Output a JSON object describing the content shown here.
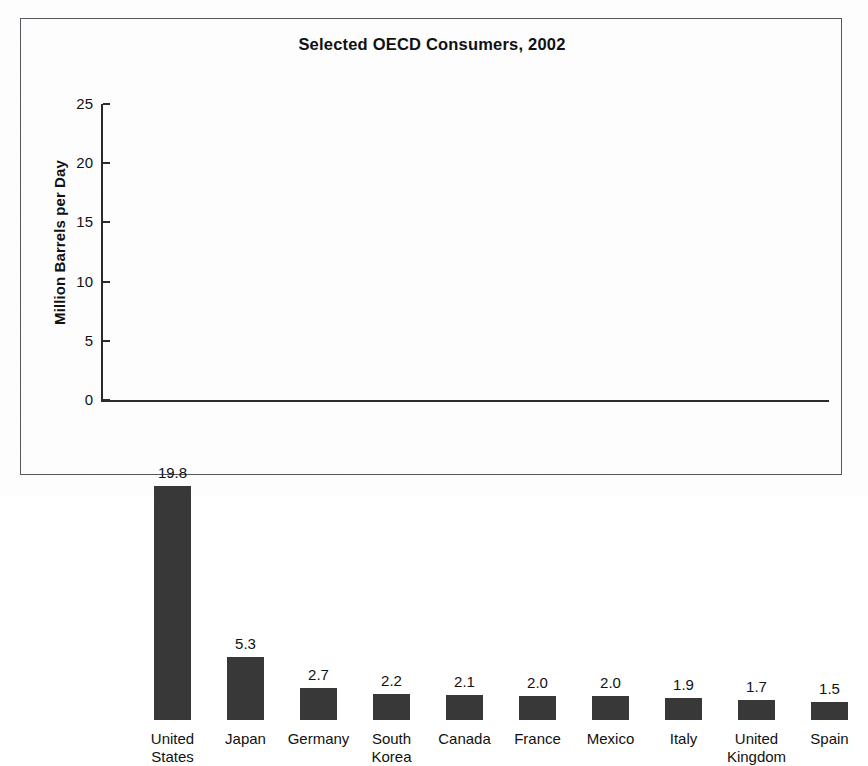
{
  "chart_data": {
    "type": "bar",
    "title": "Selected OECD Consumers, 2002",
    "xlabel": "",
    "ylabel": "Million Barrels per Day",
    "categories": [
      "United States",
      "Japan",
      "Germany",
      "South Korea",
      "Canada",
      "France",
      "Mexico",
      "Italy",
      "United Kingdom",
      "Spain"
    ],
    "category_lines": [
      [
        "United",
        "States"
      ],
      [
        "Japan",
        ""
      ],
      [
        "Germany",
        ""
      ],
      [
        "South",
        "Korea"
      ],
      [
        "Canada",
        ""
      ],
      [
        "France",
        ""
      ],
      [
        "Mexico",
        ""
      ],
      [
        "Italy",
        ""
      ],
      [
        "United",
        "Kingdom"
      ],
      [
        "Spain",
        ""
      ]
    ],
    "values": [
      19.8,
      5.3,
      2.7,
      2.2,
      2.1,
      2.0,
      2.0,
      1.9,
      1.7,
      1.5
    ],
    "value_labels": [
      "19.8",
      "5.3",
      "2.7",
      "2.2",
      "2.1",
      "2.0",
      "2.0",
      "1.9",
      "1.7",
      "1.5"
    ],
    "ylim": [
      0,
      25
    ],
    "yticks": [
      0,
      5,
      10,
      15,
      20,
      25
    ],
    "ytick_labels": [
      "0",
      "5",
      "10",
      "15",
      "20",
      "25"
    ],
    "grid": false,
    "legend": false,
    "legend_position": "none",
    "bar_color": "#383838",
    "axis_color": "#2b2b2b",
    "background_color": "#fdfdfd",
    "frame_color": "#55585c"
  }
}
